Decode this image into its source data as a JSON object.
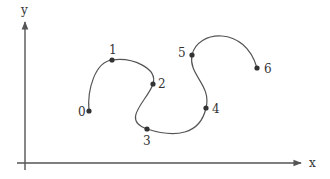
{
  "diagram": {
    "type": "curve-through-control-points",
    "axes": {
      "x_label": "x",
      "y_label": "y",
      "color": "#555555"
    },
    "points": [
      {
        "label": "0",
        "x": 89,
        "y": 111,
        "label_dx": -11,
        "label_dy": 5
      },
      {
        "label": "1",
        "x": 112,
        "y": 60,
        "label_dx": -3,
        "label_dy": -6
      },
      {
        "label": "2",
        "x": 153,
        "y": 84,
        "label_dx": 5,
        "label_dy": 4
      },
      {
        "label": "3",
        "x": 147,
        "y": 129,
        "label_dx": -4,
        "label_dy": 16
      },
      {
        "label": "4",
        "x": 206,
        "y": 108,
        "label_dx": 6,
        "label_dy": 5
      },
      {
        "label": "5",
        "x": 192,
        "y": 55,
        "label_dx": -14,
        "label_dy": 2
      },
      {
        "label": "6",
        "x": 257,
        "y": 68,
        "label_dx": 7,
        "label_dy": 5
      }
    ],
    "curve_color": "#555555",
    "point_color": "#333333"
  }
}
